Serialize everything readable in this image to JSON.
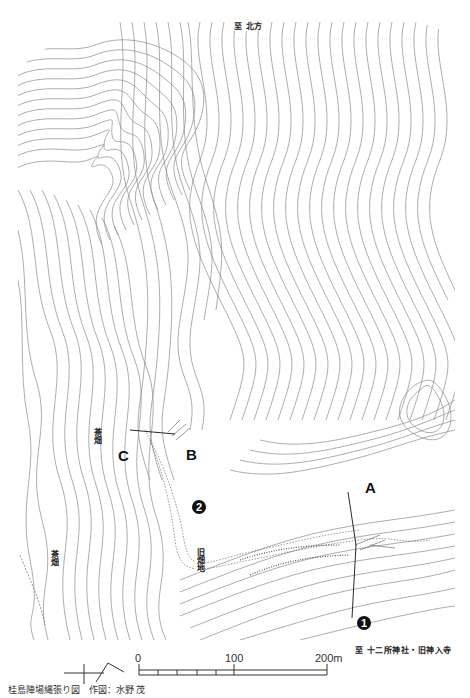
{
  "map": {
    "title_caption": "桂島陣場縄張り図",
    "author_caption": "作図：水野 茂",
    "direction_labels": {
      "north": "至 北方",
      "southeast": "至 十二所神社・旧神入寺"
    },
    "area_labels": {
      "tea_field_1": "茶畑",
      "tea_field_2": "茶畑",
      "old_field": "旧畑地"
    },
    "point_labels": {
      "A": "A",
      "B": "B",
      "C": "C"
    },
    "markers": {
      "marker_1": "1",
      "marker_2": "2"
    },
    "scale_bar": {
      "start": "0",
      "mid": "100",
      "end": "200m"
    },
    "colors": {
      "contour": "#8a8a8a",
      "ink": "#111111",
      "background": "#ffffff"
    }
  }
}
